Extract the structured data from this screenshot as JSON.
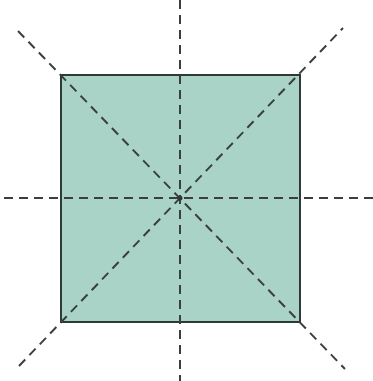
{
  "diagram": {
    "shape": {
      "type": "square",
      "fill": "#a9d3c6",
      "stroke": "#2f3a38",
      "x": 61,
      "y": 75,
      "width": 239,
      "height": 247
    },
    "center": {
      "x": 180,
      "y": 198
    },
    "symmetry_lines": [
      {
        "name": "vertical",
        "x1": 180,
        "y1": 0,
        "x2": 180,
        "y2": 381
      },
      {
        "name": "horizontal",
        "x1": 4,
        "y1": 198,
        "x2": 373,
        "y2": 198
      },
      {
        "name": "diagonal-main",
        "x1": 18,
        "y1": 31,
        "x2": 345,
        "y2": 369
      },
      {
        "name": "diagonal-anti",
        "x1": 19,
        "y1": 366,
        "x2": 343,
        "y2": 28
      }
    ],
    "line_color": "#3a3f3e",
    "line_style": "dashed"
  }
}
